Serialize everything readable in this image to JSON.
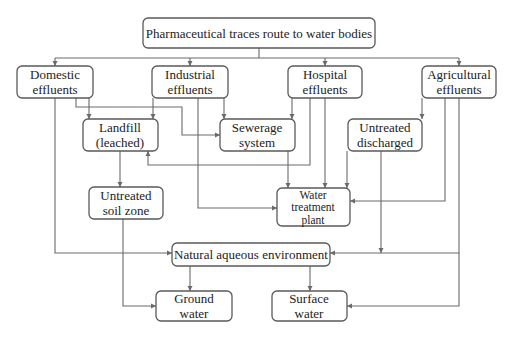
{
  "diagram": {
    "title": "Pharmaceutical traces route to water bodies",
    "colors": {
      "line": "#6a6a6a",
      "box_border": "#5a5a5a",
      "text": "#222222",
      "background": "#ffffff"
    },
    "nodes": {
      "root": {
        "lines": [
          "Pharmaceutical traces route to water bodies"
        ]
      },
      "domestic": {
        "lines": [
          "Domestic",
          "effluents"
        ]
      },
      "industrial": {
        "lines": [
          "Industrial",
          "effluents"
        ]
      },
      "hospital": {
        "lines": [
          "Hospital",
          "effluents"
        ]
      },
      "agricultural": {
        "lines": [
          "Agricultural",
          "effluents"
        ]
      },
      "landfill": {
        "lines": [
          "Landfill",
          "(leached)"
        ]
      },
      "sewerage": {
        "lines": [
          "Sewerage",
          "system"
        ]
      },
      "untreated_discharged": {
        "lines": [
          "Untreated",
          "discharged"
        ]
      },
      "untreated_soil": {
        "lines": [
          "Untreated",
          "soil zone"
        ]
      },
      "wtp": {
        "lines": [
          "Water",
          "treatment",
          "plant"
        ]
      },
      "natural": {
        "lines": [
          "Natural aqueous environment"
        ]
      },
      "ground": {
        "lines": [
          "Ground",
          "water"
        ]
      },
      "surface": {
        "lines": [
          "Surface",
          "water"
        ]
      }
    },
    "edges": [
      [
        "root",
        "domestic"
      ],
      [
        "root",
        "industrial"
      ],
      [
        "root",
        "hospital"
      ],
      [
        "root",
        "agricultural"
      ],
      [
        "domestic",
        "landfill"
      ],
      [
        "domestic",
        "sewerage"
      ],
      [
        "domestic",
        "natural"
      ],
      [
        "industrial",
        "landfill"
      ],
      [
        "industrial",
        "sewerage"
      ],
      [
        "industrial",
        "wtp"
      ],
      [
        "hospital",
        "sewerage"
      ],
      [
        "hospital",
        "landfill"
      ],
      [
        "hospital",
        "wtp"
      ],
      [
        "agricultural",
        "untreated_discharged"
      ],
      [
        "agricultural",
        "wtp"
      ],
      [
        "agricultural",
        "natural"
      ],
      [
        "agricultural",
        "surface"
      ],
      [
        "landfill",
        "untreated_soil"
      ],
      [
        "untreated_soil",
        "ground"
      ],
      [
        "sewerage",
        "wtp"
      ],
      [
        "untreated_discharged",
        "wtp"
      ],
      [
        "untreated_discharged",
        "natural"
      ],
      [
        "natural",
        "ground"
      ],
      [
        "natural",
        "surface"
      ]
    ]
  }
}
